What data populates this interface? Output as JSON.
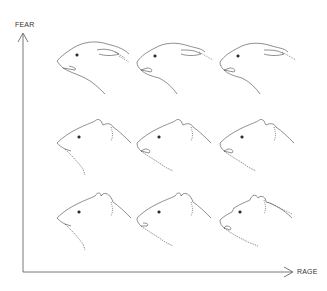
{
  "axes": {
    "y_label": "FEAR",
    "x_label": "RAGE"
  },
  "grid": {
    "rows": 3,
    "cols": 3,
    "description": "Wolf head sketches; fear decreases downward, rage increases rightward",
    "cells": [
      {
        "row": 0,
        "col": 0,
        "fear": "high",
        "rage": "low",
        "ears": "flat-back",
        "mouth": "slightly-open"
      },
      {
        "row": 0,
        "col": 1,
        "fear": "high",
        "rage": "medium",
        "ears": "flat-back",
        "mouth": "open-snarl"
      },
      {
        "row": 0,
        "col": 2,
        "fear": "high",
        "rage": "high",
        "ears": "flat-back",
        "mouth": "open-snarl"
      },
      {
        "row": 1,
        "col": 0,
        "fear": "medium",
        "rage": "low",
        "ears": "half-up",
        "mouth": "closed"
      },
      {
        "row": 1,
        "col": 1,
        "fear": "medium",
        "rage": "medium",
        "ears": "half-up",
        "mouth": "open-snarl"
      },
      {
        "row": 1,
        "col": 2,
        "fear": "medium",
        "rage": "high",
        "ears": "half-up",
        "mouth": "open-snarl"
      },
      {
        "row": 2,
        "col": 0,
        "fear": "low",
        "rage": "low",
        "ears": "erect",
        "mouth": "closed"
      },
      {
        "row": 2,
        "col": 1,
        "fear": "low",
        "rage": "medium",
        "ears": "erect",
        "mouth": "slightly-open"
      },
      {
        "row": 2,
        "col": 2,
        "fear": "low",
        "rage": "high",
        "ears": "erect",
        "mouth": "open-snarl"
      }
    ]
  }
}
